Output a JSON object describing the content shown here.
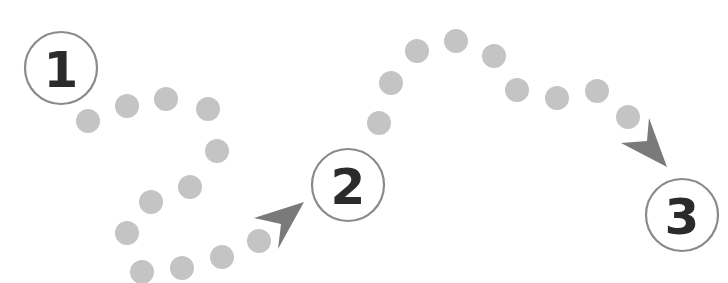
{
  "diagram": {
    "type": "numbered-step-path",
    "colors": {
      "background": "#ffffff",
      "dot": "#c4c4c4",
      "arrow": "#7a7a7a",
      "ring": "#8a8a8a",
      "number": "#2b2b2b"
    },
    "steps": [
      {
        "label": "1",
        "cx": 61,
        "cy": 68,
        "r": 36
      },
      {
        "label": "2",
        "cx": 348,
        "cy": 185,
        "r": 36
      },
      {
        "label": "3",
        "cx": 682,
        "cy": 215,
        "r": 36
      }
    ],
    "paths": [
      {
        "from": "1",
        "to": "2",
        "dots": [
          [
            88,
            121
          ],
          [
            127,
            106
          ],
          [
            166,
            99
          ],
          [
            208,
            109
          ],
          [
            217,
            151
          ],
          [
            190,
            187
          ],
          [
            151,
            202
          ],
          [
            127,
            233
          ],
          [
            142,
            272
          ],
          [
            182,
            268
          ],
          [
            222,
            257
          ],
          [
            259,
            241
          ]
        ],
        "arrow": {
          "tip": [
            304,
            202
          ],
          "left": [
            254,
            218
          ],
          "notch": [
            281,
            224
          ],
          "right": [
            278,
            249
          ]
        }
      },
      {
        "from": "2",
        "to": "3",
        "dots": [
          [
            379,
            123
          ],
          [
            391,
            83
          ],
          [
            417,
            51
          ],
          [
            456,
            41
          ],
          [
            494,
            56
          ],
          [
            517,
            90
          ],
          [
            557,
            98
          ],
          [
            597,
            91
          ],
          [
            628,
            117
          ]
        ],
        "arrow": {
          "tip": [
            667,
            167
          ],
          "left": [
            621,
            143
          ],
          "notch": [
            647,
            141
          ],
          "right": [
            649,
            118
          ]
        }
      }
    ],
    "dot_radius": 12
  }
}
